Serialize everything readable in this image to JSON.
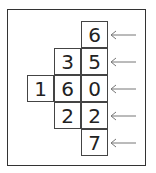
{
  "diagram": {
    "cells": [
      {
        "row": 0,
        "col": 2,
        "value": "6"
      },
      {
        "row": 1,
        "col": 1,
        "value": "3"
      },
      {
        "row": 1,
        "col": 2,
        "value": "5"
      },
      {
        "row": 2,
        "col": 0,
        "value": "1"
      },
      {
        "row": 2,
        "col": 1,
        "value": "6"
      },
      {
        "row": 2,
        "col": 2,
        "value": "0"
      },
      {
        "row": 3,
        "col": 1,
        "value": "2"
      },
      {
        "row": 3,
        "col": 2,
        "value": "2"
      },
      {
        "row": 4,
        "col": 2,
        "value": "7"
      }
    ],
    "arrow_rows": [
      0,
      1,
      2,
      3,
      4
    ],
    "arrow_icon": "left-arrow",
    "row_numbers": [
      "6",
      "35",
      "160",
      "22",
      "7"
    ]
  },
  "colors": {
    "line": "#444444",
    "text": "#222222",
    "arrow": "#777777"
  }
}
